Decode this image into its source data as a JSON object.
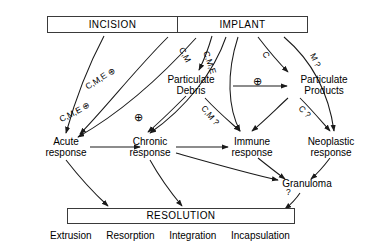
{
  "diagram": {
    "title_top_boxes": {
      "incision": "INCISION",
      "implant": "IMPLANT"
    },
    "bottom_box": {
      "resolution": "RESOLUTION"
    },
    "intermediate_nodes": [
      {
        "id": "particulate-debris",
        "line1": "Particulate",
        "line2": "Debris"
      },
      {
        "id": "soluble-products",
        "line1": "Soluble",
        "line2": "Products"
      }
    ],
    "response_nodes": [
      {
        "id": "acute-response",
        "line1": "Acute",
        "line2": "response"
      },
      {
        "id": "chronic-response",
        "line1": "Chronic",
        "line2": "response"
      },
      {
        "id": "immune-response",
        "line1": "Immune",
        "line2": "response"
      },
      {
        "id": "neoplastic-response",
        "line1": "Neoplastic",
        "line2": "response"
      }
    ],
    "granuloma": {
      "label": "Granuloma",
      "annotation": "?"
    },
    "edge_labels": [
      {
        "id": "cme-plus-upper",
        "text": "C,M,E",
        "marker": "⊕"
      },
      {
        "id": "cme-plus-lower",
        "text": "C,M,E",
        "marker": "⊕"
      },
      {
        "id": "cm-debris",
        "text": "C,M"
      },
      {
        "id": "cme-immune",
        "text": "C,M,E"
      },
      {
        "id": "c-soluble",
        "text": "C"
      },
      {
        "id": "m-question",
        "text": "M ?"
      },
      {
        "id": "cm-question",
        "text": "C,M ?"
      },
      {
        "id": "c-question",
        "text": "C ?"
      },
      {
        "id": "plus-chronic",
        "marker": "⊕"
      },
      {
        "id": "plus-debris-to-soluble",
        "marker": "⊕"
      }
    ],
    "outcomes": [
      "Extrusion",
      "Resorption",
      "Integration",
      "Incapsulation"
    ],
    "colors": {
      "stroke": "#1a1a1a",
      "box_border": "#3a3a3a",
      "background": "#ffffff",
      "text": "#000000"
    }
  }
}
